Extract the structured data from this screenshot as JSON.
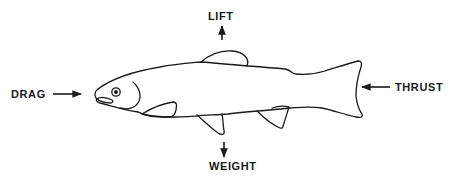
{
  "diagram": {
    "forces": {
      "lift": {
        "label": "LIFT",
        "direction": "up"
      },
      "drag": {
        "label": "DRAG",
        "direction": "right"
      },
      "thrust": {
        "label": "THRUST",
        "direction": "left"
      },
      "weight": {
        "label": "WEIGHT",
        "direction": "down"
      }
    },
    "colors": {
      "ink": "#1a1a1a",
      "background": "#ffffff"
    }
  }
}
